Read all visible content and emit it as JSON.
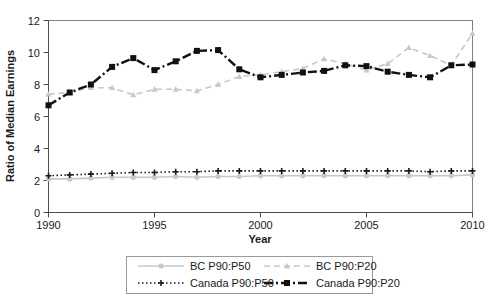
{
  "chart_data": {
    "type": "line",
    "title": "",
    "xlabel": "Year",
    "ylabel": "Ratio of Median Earnings",
    "xlim": [
      1990,
      2010
    ],
    "ylim": [
      0,
      12
    ],
    "grid": false,
    "legend_position": "bottom-center",
    "xticks": [
      "1990",
      "1995",
      "2000",
      "2005",
      "2010"
    ],
    "yticks": [
      "0",
      "2",
      "4",
      "6",
      "8",
      "10",
      "12"
    ],
    "x": [
      1990,
      1991,
      1992,
      1993,
      1994,
      1995,
      1996,
      1997,
      1998,
      1999,
      2000,
      2001,
      2002,
      2003,
      2004,
      2005,
      2006,
      2007,
      2008,
      2009,
      2010
    ],
    "series": [
      {
        "name": "BC P90:P50",
        "color": "#c8c8c8",
        "marker": "circle",
        "style": "solid",
        "values": [
          2.1,
          2.1,
          2.15,
          2.2,
          2.2,
          2.2,
          2.25,
          2.2,
          2.25,
          2.25,
          2.3,
          2.3,
          2.3,
          2.3,
          2.3,
          2.3,
          2.3,
          2.3,
          2.3,
          2.3,
          2.35
        ]
      },
      {
        "name": "BC P90:P20",
        "color": "#c8c8c8",
        "marker": "triangle",
        "style": "dashed",
        "values": [
          7.4,
          7.5,
          7.8,
          7.8,
          7.35,
          7.7,
          7.7,
          7.6,
          8.0,
          8.5,
          8.6,
          8.8,
          9.0,
          9.6,
          9.3,
          8.9,
          9.3,
          10.3,
          9.8,
          9.2,
          11.2
        ]
      },
      {
        "name": "Canada P90:P50",
        "color": "#1a1a1a",
        "marker": "plus",
        "style": "dotted",
        "values": [
          2.3,
          2.35,
          2.4,
          2.45,
          2.5,
          2.5,
          2.55,
          2.55,
          2.6,
          2.6,
          2.6,
          2.6,
          2.6,
          2.6,
          2.6,
          2.6,
          2.6,
          2.6,
          2.55,
          2.6,
          2.6
        ]
      },
      {
        "name": "Canada P90:P20",
        "color": "#111111",
        "marker": "square",
        "style": "dashdot",
        "values": [
          6.7,
          7.5,
          8.0,
          9.1,
          9.65,
          8.9,
          9.45,
          10.1,
          10.15,
          8.95,
          8.45,
          8.6,
          8.75,
          8.85,
          9.2,
          9.15,
          8.8,
          8.6,
          8.45,
          9.2,
          9.25
        ]
      }
    ]
  },
  "legend": {
    "entries": [
      {
        "label": "BC P90:P50"
      },
      {
        "label": "BC P90:P20"
      },
      {
        "label": "Canada P90:P50"
      },
      {
        "label": "Canada P90:P20"
      }
    ]
  },
  "axes": {
    "y_title": "Ratio of Median Earnings",
    "x_title": "Year"
  },
  "colors": {
    "bc": "#c8c8c8",
    "canada": "#111111",
    "frame": "#808080",
    "text": "#1a1a1a"
  }
}
